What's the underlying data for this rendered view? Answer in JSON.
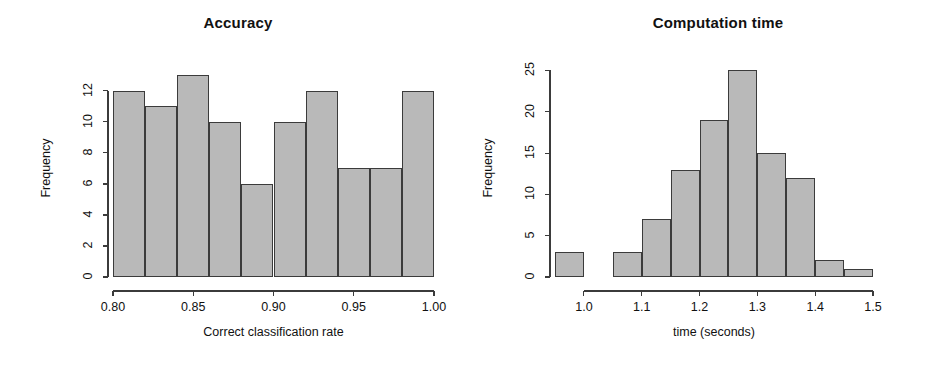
{
  "figure": {
    "background": "#ffffff",
    "bar_fill": "#b9b9b9",
    "bar_stroke": "#3b3b3b",
    "axis_color": "#3b3b3b"
  },
  "panels": [
    {
      "id": "accuracy",
      "title": "Accuracy",
      "xlabel": "Correct classification rate",
      "ylabel": "Frequency",
      "x_ticks": [
        "0.80",
        "0.85",
        "0.90",
        "0.95",
        "1.00"
      ],
      "y_ticks": [
        "0",
        "2",
        "4",
        "6",
        "8",
        "10",
        "12"
      ]
    },
    {
      "id": "time",
      "title": "Computation time",
      "xlabel": "time (seconds)",
      "ylabel": "Frequency",
      "x_ticks": [
        "1.0",
        "1.1",
        "1.2",
        "1.3",
        "1.4",
        "1.5"
      ],
      "y_ticks": [
        "0",
        "5",
        "10",
        "15",
        "20",
        "25"
      ]
    }
  ],
  "chart_data": [
    {
      "type": "bar",
      "title": "Accuracy",
      "xlabel": "Correct classification rate",
      "ylabel": "Frequency",
      "bin_width": 0.02,
      "bin_edges": [
        0.8,
        0.82,
        0.84,
        0.86,
        0.88,
        0.9,
        0.92,
        0.94,
        0.96,
        0.98,
        1.0
      ],
      "categories": [
        "0.80-0.82",
        "0.82-0.84",
        "0.84-0.86",
        "0.86-0.88",
        "0.88-0.90",
        "0.90-0.92",
        "0.92-0.94",
        "0.94-0.96",
        "0.96-0.98",
        "0.98-1.00"
      ],
      "values": [
        12,
        11,
        13,
        10,
        6,
        10,
        12,
        7,
        7,
        12
      ],
      "xlim": [
        0.8,
        1.0
      ],
      "ylim": [
        0,
        13
      ],
      "x_tick_values": [
        0.8,
        0.85,
        0.9,
        0.95,
        1.0
      ],
      "y_tick_values": [
        0,
        2,
        4,
        6,
        8,
        10,
        12
      ],
      "grid": false,
      "legend": null
    },
    {
      "type": "bar",
      "title": "Computation time",
      "xlabel": "time (seconds)",
      "ylabel": "Frequency",
      "bin_width": 0.05,
      "bin_edges": [
        0.95,
        1.0,
        1.05,
        1.1,
        1.15,
        1.2,
        1.25,
        1.3,
        1.35,
        1.4,
        1.45,
        1.5
      ],
      "categories": [
        "0.95-1.00",
        "1.00-1.05",
        "1.05-1.10",
        "1.10-1.15",
        "1.15-1.20",
        "1.20-1.25",
        "1.25-1.30",
        "1.30-1.35",
        "1.35-1.40",
        "1.40-1.45",
        "1.45-1.50"
      ],
      "values": [
        3,
        0,
        3,
        7,
        13,
        19,
        25,
        15,
        12,
        2,
        1
      ],
      "xlim": [
        0.95,
        1.5
      ],
      "ylim": [
        0,
        25
      ],
      "x_tick_values": [
        1.0,
        1.1,
        1.2,
        1.3,
        1.4,
        1.5
      ],
      "y_tick_values": [
        0,
        5,
        10,
        15,
        20,
        25
      ],
      "grid": false,
      "legend": null
    }
  ]
}
